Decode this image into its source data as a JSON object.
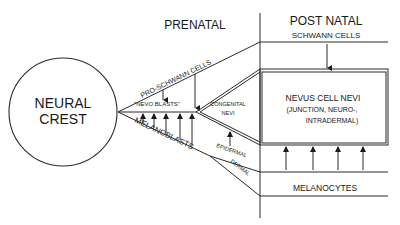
{
  "diagram": {
    "type": "lineage flow diagram",
    "sections": {
      "prenatal": "PRENATAL",
      "postnatal": "POST NATAL"
    },
    "origin": {
      "line1": "NEURAL",
      "line2": "CREST"
    },
    "branches": {
      "pro_schwann": "PRO-SCHWANN CELLS",
      "nevo_blasts": "\"NEVO BLASTS\"",
      "melanoblasts": "MELANOBLASTS",
      "epidermal": "EPIDERMAL",
      "dermal": "DERMAL",
      "congenital_line1": "CONGENITAL",
      "congenital_line2": "NEVI"
    },
    "outcomes": {
      "schwann_cells": "SCHWANN CELLS",
      "nevus_title": "NEVUS CELL NEVI",
      "nevus_sub1": "(JUNCTION, NEURO-,",
      "nevus_sub2": "INTRADERMAL)",
      "melanocytes": "MELANOCYTES"
    },
    "colors": {
      "ink": "#1a1a1a",
      "background": "#ffffff"
    }
  }
}
